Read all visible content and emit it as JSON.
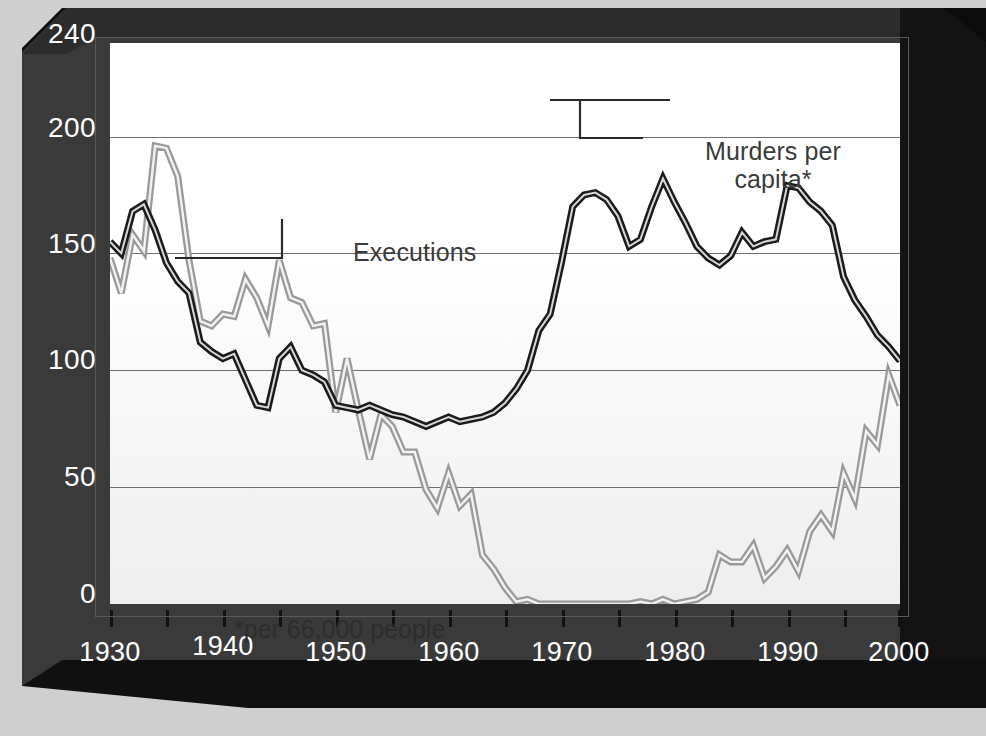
{
  "chart_data": {
    "type": "line",
    "title": "",
    "xlabel": "",
    "ylabel": "",
    "xlim": [
      1930,
      2000
    ],
    "ylim": [
      0,
      240
    ],
    "grid": true,
    "grid_values": [
      200,
      150,
      100,
      50,
      0
    ],
    "y_ticks": [
      "240",
      "200",
      "150",
      "100",
      "50",
      "0"
    ],
    "y_tick_values": [
      240,
      200,
      150,
      100,
      50,
      0
    ],
    "x_ticks": [
      "1930",
      "1940",
      "1950",
      "1960",
      "1970",
      "1980",
      "1990",
      "2000"
    ],
    "x_tick_values": [
      1930,
      1940,
      1950,
      1960,
      1970,
      1980,
      1990,
      2000
    ],
    "x_minor_tick_interval": 5,
    "legend_position": "inline-annotations",
    "footnote": "*per 66,000 people",
    "annotations": [
      {
        "label": "Executions",
        "points_to_series": "Executions",
        "points_to_year": 1937
      },
      {
        "label_line1": "Murders per",
        "label_line2": "capita*",
        "points_to_series": "Murders per capita*",
        "points_to_year": 1978
      }
    ],
    "colors": {
      "executions": "#9a9a9a",
      "murders": "#1b1b1b",
      "gridline": "#6f6f6f",
      "frame": "#3a3a3a",
      "plot_bg": "#ffffff"
    },
    "x": [
      1930,
      1931,
      1932,
      1933,
      1934,
      1935,
      1936,
      1937,
      1938,
      1939,
      1940,
      1941,
      1942,
      1943,
      1944,
      1945,
      1946,
      1947,
      1948,
      1949,
      1950,
      1951,
      1952,
      1953,
      1954,
      1955,
      1956,
      1957,
      1958,
      1959,
      1960,
      1961,
      1962,
      1963,
      1964,
      1965,
      1966,
      1967,
      1968,
      1969,
      1970,
      1971,
      1972,
      1973,
      1974,
      1975,
      1976,
      1977,
      1978,
      1979,
      1980,
      1981,
      1982,
      1983,
      1984,
      1985,
      1986,
      1987,
      1988,
      1989,
      1990,
      1991,
      1992,
      1993,
      1994,
      1995,
      1996,
      1997,
      1998,
      1999,
      2000
    ],
    "series": [
      {
        "name": "Executions",
        "color": "#9a9a9a",
        "values": [
          148,
          133,
          158,
          151,
          196,
          195,
          183,
          147,
          121,
          119,
          124,
          123,
          139,
          131,
          119,
          147,
          131,
          129,
          119,
          120,
          82,
          105,
          83,
          62,
          81,
          76,
          65,
          65,
          49,
          41,
          56,
          42,
          47,
          21,
          15,
          7,
          1,
          2,
          0,
          0,
          0,
          0,
          0,
          0,
          0,
          0,
          0,
          1,
          0,
          2,
          0,
          1,
          2,
          5,
          21,
          18,
          18,
          25,
          11,
          16,
          23,
          14,
          31,
          38,
          31,
          56,
          45,
          74,
          68,
          98,
          85
        ]
      },
      {
        "name": "Murders per capita*",
        "color": "#1b1b1b",
        "values": [
          155,
          150,
          168,
          171,
          160,
          146,
          138,
          133,
          112,
          108,
          105,
          107,
          96,
          85,
          84,
          105,
          110,
          100,
          98,
          95,
          85,
          84,
          83,
          85,
          83,
          81,
          80,
          78,
          76,
          78,
          80,
          78,
          79,
          80,
          82,
          86,
          92,
          100,
          117,
          124,
          146,
          170,
          175,
          176,
          173,
          166,
          153,
          156,
          170,
          182,
          172,
          163,
          153,
          148,
          145,
          149,
          159,
          153,
          155,
          156,
          179,
          178,
          172,
          168,
          162,
          140,
          130,
          123,
          115,
          110,
          104
        ]
      }
    ]
  },
  "axis": {
    "y_labels": [
      "240",
      "200",
      "150",
      "100",
      "50",
      "0"
    ],
    "x_labels": [
      "1930",
      "1940",
      "1950",
      "1960",
      "1970",
      "1980",
      "1990",
      "2000"
    ]
  },
  "annotations": {
    "executions_label": "Executions",
    "murders_label_line1": "Murders per",
    "murders_label_line2": "capita*",
    "footnote": "*per 66,000 people"
  }
}
